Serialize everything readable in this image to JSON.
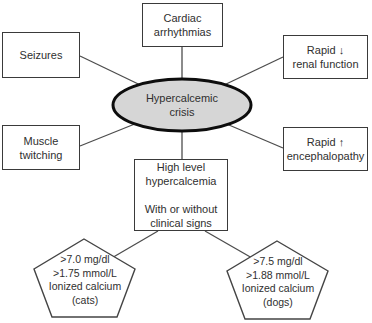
{
  "diagram_title": "Hypercalcemic crisis",
  "nodes": {
    "cardiac": {
      "label": "Cardiac\narrhythmias"
    },
    "seizures": {
      "label": "Seizures"
    },
    "renal": {
      "label": "Rapid ↓\nrenal function"
    },
    "muscle": {
      "label": "Muscle\ntwitching"
    },
    "encephalopathy": {
      "label": "Rapid ↑\nencephalopathy"
    },
    "center": {
      "label": "Hypercalcemic\ncrisis"
    },
    "high_level": {
      "label": "High level\nhypercalcemia\n\nWith or without\nclinical signs"
    },
    "cats": {
      "label": ">7.0 mg/dl\n>1.75 mmol/L\nIonized calcium\n(cats)"
    },
    "dogs": {
      "label": ">7.5 mg/dl\n>1.88 mmol/L\nIonized calcium\n(dogs)"
    }
  },
  "colors": {
    "ellipse_fill": "#d6d6d6",
    "ellipse_stroke": "#0d0d0d",
    "box_border": "#3a3a3a",
    "connector": "#4d4d4d",
    "pentagon_stroke": "#444444",
    "background": "#ffffff",
    "text": "#2f2f2f"
  }
}
